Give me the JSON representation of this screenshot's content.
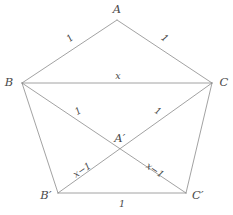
{
  "figure": {
    "background_color": "#ffffff",
    "line_color": "#8a8a8a",
    "text_color": "#4a4a4a",
    "stroke_width": 0.8,
    "vertices": {
      "A": {
        "label": "A",
        "x": 117,
        "y": 20,
        "label_x": 117,
        "label_y": 10
      },
      "B": {
        "label": "B",
        "x": 22,
        "y": 83,
        "label_x": 9,
        "label_y": 83
      },
      "C": {
        "label": "C",
        "x": 212,
        "y": 83,
        "label_x": 224,
        "label_y": 83
      },
      "Bp": {
        "label": "B′",
        "x": 58,
        "y": 193,
        "label_x": 46,
        "label_y": 196
      },
      "Cp": {
        "label": "C′",
        "x": 186,
        "y": 193,
        "label_x": 198,
        "label_y": 196
      },
      "Ap": {
        "label": "A′",
        "x": 120,
        "y": 150,
        "label_x": 120,
        "label_y": 139
      }
    },
    "segments": [
      {
        "name": "edge-A-B",
        "from": "A",
        "to": "B"
      },
      {
        "name": "edge-A-C",
        "from": "A",
        "to": "C"
      },
      {
        "name": "segment-B-C",
        "from": "B",
        "to": "C"
      },
      {
        "name": "edge-B-Bprime",
        "from": "B",
        "to": "Bp"
      },
      {
        "name": "edge-C-Cprime",
        "from": "C",
        "to": "Cp"
      },
      {
        "name": "edge-Bprime-Cprime",
        "from": "Bp",
        "to": "Cp"
      },
      {
        "name": "diagonal-B-Cprime",
        "from": "B",
        "to": "Cp"
      },
      {
        "name": "diagonal-C-Bprime",
        "from": "C",
        "to": "Bp"
      }
    ],
    "edge_labels": [
      {
        "name": "length-label-AB",
        "text": "1",
        "x": 70,
        "y": 38,
        "rotation_class": "rot-ab"
      },
      {
        "name": "length-label-AC",
        "text": "1",
        "x": 165,
        "y": 38,
        "rotation_class": "rot-ac"
      },
      {
        "name": "length-label-BC",
        "text": "x",
        "x": 118,
        "y": 76,
        "rotation_class": ""
      },
      {
        "name": "length-label-B-Cprime",
        "text": "1",
        "x": 78,
        "y": 111,
        "rotation_class": "rot-bcp"
      },
      {
        "name": "length-label-C-Bprime",
        "text": "1",
        "x": 158,
        "y": 111,
        "rotation_class": "rot-cbp"
      },
      {
        "name": "length-label-Bprime-C",
        "text": "x−1",
        "x": 82,
        "y": 170,
        "rotation_class": "rot-bpc"
      },
      {
        "name": "length-label-Cprime-B",
        "text": "x−1",
        "x": 155,
        "y": 170,
        "rotation_class": "rot-cpb"
      },
      {
        "name": "length-label-BprimeCprime",
        "text": "1",
        "x": 122,
        "y": 204,
        "rotation_class": ""
      }
    ]
  }
}
